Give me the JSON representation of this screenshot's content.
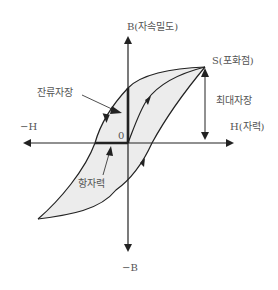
{
  "diagram": {
    "type": "hysteresis-loop",
    "axes": {
      "y_positive_label": "B(자속밀도)",
      "y_negative_label": "−B",
      "x_positive_label": "H(자력)",
      "x_negative_label": "−H",
      "origin_label": "0"
    },
    "annotations": {
      "saturation": "S(포화점)",
      "max_field": "최대자장",
      "remanence": "잔류자장",
      "coercivity": "항자력"
    },
    "colors": {
      "line": "#222222",
      "fill": "#ececec",
      "text": "#555555"
    }
  }
}
